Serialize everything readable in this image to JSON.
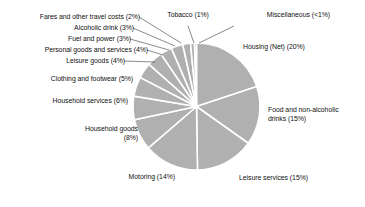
{
  "chart_data": {
    "type": "pie",
    "title": "",
    "subtitle": "",
    "xlabel": "",
    "ylabel": "",
    "legend_position": "labels-with-leader-lines",
    "grid": false,
    "units": "percent",
    "start_angle_deg": 0,
    "direction": "clockwise",
    "fill_color": "#b0b0b0",
    "separator_color": "#ffffff",
    "leader_line_color": "#3a3a3a",
    "categories": [
      "Housing (Net)",
      "Food and non-alcoholic drinks",
      "Leisure services",
      "Motoring",
      "Household goods",
      "Household services",
      "Clothing and footwear",
      "Leisure goods",
      "Personal goods and services",
      "Fuel and power",
      "Alcoholic drink",
      "Fares and other travel costs",
      "Tobacco",
      "Miscellaneous"
    ],
    "values": [
      20,
      15,
      15,
      14,
      8,
      6,
      5,
      4,
      4,
      3,
      3,
      2,
      1,
      0.5
    ],
    "value_labels": [
      "20%",
      "15%",
      "15%",
      "14%",
      "8%",
      "6%",
      "5%",
      "4%",
      "4%",
      "3%",
      "3%",
      "2%",
      "1%",
      "<1%"
    ],
    "slices": [
      {
        "name": "housing-net",
        "label": "Housing (Net) (20%)",
        "value": 20,
        "display": "20%"
      },
      {
        "name": "food-and-non-alcoholic-drinks",
        "label": "Food and non-alcoholic\ndrinks (15%)",
        "value": 15,
        "display": "15%"
      },
      {
        "name": "leisure-services",
        "label": "Leisure services (15%)",
        "value": 15,
        "display": "15%"
      },
      {
        "name": "motoring",
        "label": "Motoring (14%)",
        "value": 14,
        "display": "14%"
      },
      {
        "name": "household-goods",
        "label": "Household goods\n(8%)",
        "value": 8,
        "display": "8%"
      },
      {
        "name": "household-services",
        "label": "Household services (6%)",
        "value": 6,
        "display": "6%"
      },
      {
        "name": "clothing-and-footwear",
        "label": "Clothing and footwear (5%)",
        "value": 5,
        "display": "5%"
      },
      {
        "name": "leisure-goods",
        "label": "Leisure goods (4%)",
        "value": 4,
        "display": "4%"
      },
      {
        "name": "personal-goods-and-services",
        "label": "Personal goods and services (4%)",
        "value": 4,
        "display": "4%"
      },
      {
        "name": "fuel-and-power",
        "label": "Fuel and power (3%)",
        "value": 3,
        "display": "3%"
      },
      {
        "name": "alcoholic-drink",
        "label": "Alcoholic drink (3%)",
        "value": 3,
        "display": "3%"
      },
      {
        "name": "fares-and-other-travel-costs",
        "label": "Fares and other travel costs (2%)",
        "value": 2,
        "display": "2%"
      },
      {
        "name": "tobacco",
        "label": "Tobacco (1%)",
        "value": 1,
        "display": "1%"
      },
      {
        "name": "miscellaneous",
        "label": "Miscellaneous (<1%)",
        "value": 0.5,
        "display": "<1%"
      }
    ]
  }
}
